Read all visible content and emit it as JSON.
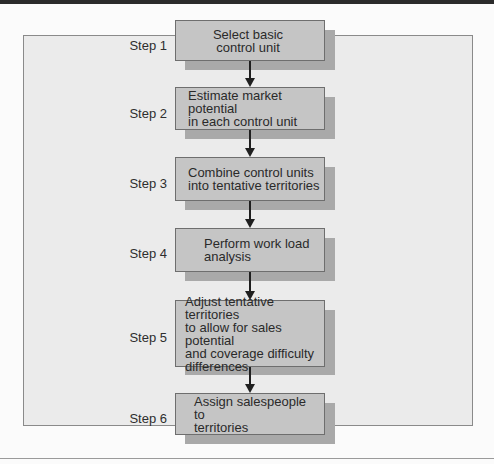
{
  "diagram": {
    "type": "flowchart",
    "direction": "top-to-bottom",
    "colors": {
      "box_fill": "#c5c5c5",
      "box_shadow": "#a9a9a9",
      "frame_fill": "#ebebeb",
      "arrow": "#1f1f1f"
    },
    "steps": [
      {
        "label": "Step 1",
        "lines": [
          "Select basic",
          "control unit"
        ]
      },
      {
        "label": "Step 2",
        "lines": [
          "Estimate market potential",
          "in each control unit"
        ]
      },
      {
        "label": "Step 3",
        "lines": [
          "Combine control units",
          "into tentative territories"
        ]
      },
      {
        "label": "Step 4",
        "lines": [
          "Perform work load",
          "analysis"
        ]
      },
      {
        "label": "Step 5",
        "lines": [
          "Adjust tentative territories",
          "to allow for sales potential",
          "and coverage difficulty",
          "differences"
        ]
      },
      {
        "label": "Step 6",
        "lines": [
          "Assign salespeople to",
          "territories"
        ]
      }
    ],
    "edges": [
      {
        "from": "Step 1",
        "to": "Step 2"
      },
      {
        "from": "Step 2",
        "to": "Step 3"
      },
      {
        "from": "Step 3",
        "to": "Step 4"
      },
      {
        "from": "Step 4",
        "to": "Step 5"
      },
      {
        "from": "Step 5",
        "to": "Step 6"
      }
    ]
  }
}
